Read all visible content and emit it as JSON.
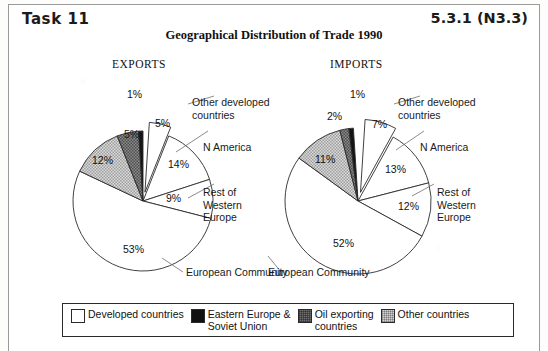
{
  "header": {
    "task_label": "Task 11",
    "reference": "5.3.1 (N3.3)",
    "title": "Geographical Distribution of Trade 1990"
  },
  "chart_data": {
    "type": "pie",
    "title": "Geographical Distribution of Trade 1990",
    "legend_position": "bottom",
    "legend": [
      {
        "label": "Developed countries",
        "color": "#ffffff",
        "pattern": "solid-white"
      },
      {
        "label": "Eastern Europe &\nSoviet Union",
        "color": "#111111",
        "pattern": "solid-black"
      },
      {
        "label": "Oil exporting\ncountries",
        "color": "#6e6e6e",
        "pattern": "dark-checker"
      },
      {
        "label": "Other countries",
        "color": "#d2d2d2",
        "pattern": "light-checker"
      }
    ],
    "charts": [
      {
        "name": "EXPORTS",
        "categories": [
          "Other developed countries",
          "N America",
          "Rest of Western Europe",
          "European Community",
          "Other countries",
          "Oil exporting countries",
          "Eastern Europe & Soviet Union"
        ],
        "values": [
          5,
          14,
          9,
          53,
          12,
          5,
          1
        ],
        "value_labels": [
          "5%",
          "14%",
          "9%",
          "53%",
          "12%",
          "5%",
          "1%"
        ],
        "fills": [
          "solid-white",
          "solid-white",
          "solid-white",
          "solid-white",
          "light-checker",
          "dark-checker",
          "solid-black"
        ],
        "exploded": [
          "Other developed countries"
        ],
        "callout_labels": [
          {
            "text": "Other developed\ncountries",
            "target": "Other developed countries"
          },
          {
            "text": "N America",
            "target": "N America"
          },
          {
            "text": "Rest of\nWestern\nEurope",
            "target": "Rest of Western Europe"
          },
          {
            "text": "European Community",
            "target": "European Community"
          }
        ]
      },
      {
        "name": "IMPORTS",
        "categories": [
          "Other developed countries",
          "N America",
          "Rest of Western Europe",
          "European Community",
          "Other countries",
          "Oil exporting countries",
          "Eastern Europe & Soviet Union"
        ],
        "values": [
          7,
          13,
          12,
          52,
          11,
          2,
          1
        ],
        "value_labels": [
          "7%",
          "13%",
          "12%",
          "52%",
          "11%",
          "2%",
          "1%"
        ],
        "fills": [
          "solid-white",
          "solid-white",
          "solid-white",
          "solid-white",
          "light-checker",
          "dark-checker",
          "solid-black"
        ],
        "exploded": [
          "Other developed countries"
        ],
        "callout_labels": [
          {
            "text": "Other developed\ncountries",
            "target": "Other developed countries"
          },
          {
            "text": "N America",
            "target": "N America"
          },
          {
            "text": "Rest of\nWestern\nEurope",
            "target": "Rest of Western Europe"
          },
          {
            "text": "European Community",
            "target": "European Community"
          }
        ]
      }
    ]
  },
  "exports": {
    "heading": "EXPORTS",
    "pct": {
      "p1": "1%",
      "p5a": "5%",
      "p14": "14%",
      "p9": "9%",
      "p53": "53%",
      "p12": "12%",
      "p5b": "5%"
    },
    "labels": {
      "other_developed": "Other developed\ncountries",
      "n_america": "N America",
      "rest_west_europe": "Rest of\nWestern\nEurope",
      "european_community": "European Community"
    }
  },
  "imports": {
    "heading": "IMPORTS",
    "pct": {
      "p1": "1%",
      "p2": "2%",
      "p11": "11%",
      "p7": "7%",
      "p13": "13%",
      "p12": "12%",
      "p52": "52%"
    },
    "labels": {
      "other_developed": "Other developed\ncountries",
      "n_america": "N America",
      "rest_west_europe": "Rest of\nWestern\nEurope",
      "european_community": "European Community"
    }
  },
  "legend": {
    "items": [
      {
        "label": "Developed countries"
      },
      {
        "label": "Eastern Europe &\nSoviet Union"
      },
      {
        "label": "Oil exporting\ncountries"
      },
      {
        "label": "Other countries"
      }
    ]
  }
}
